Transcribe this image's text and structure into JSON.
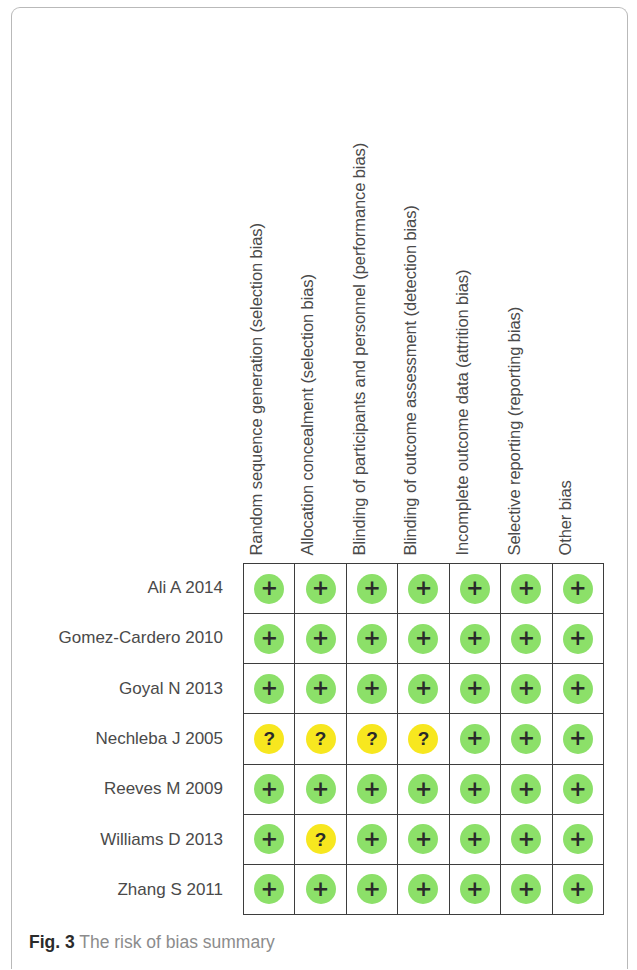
{
  "figure": {
    "caption_label": "Fig. 3",
    "caption_text": "The risk of bias summary",
    "colors": {
      "low_risk": "#8ce069",
      "unclear_risk": "#f7e71f",
      "grid_line": "#3d3d3d",
      "text": "#4a4a4a",
      "caption_text": "#8c8c8c"
    },
    "legend_glyphs": {
      "low_risk": "+",
      "unclear_risk": "?"
    }
  },
  "chart_data": {
    "type": "heatmap",
    "title": "The risk of bias summary",
    "xlabel": "",
    "ylabel": "",
    "grid": true,
    "legend_position": "none",
    "categories": [
      "Random sequence generation (selection bias)",
      "Allocation concealment (selection bias)",
      "Blinding of participants and personnel (performance bias)",
      "Blinding of outcome assessment (detection bias)",
      "Incomplete outcome data (attrition bias)",
      "Selective reporting (reporting bias)",
      "Other bias"
    ],
    "rows": [
      "Ali A 2014",
      "Gomez-Cardero 2010",
      "Goyal N 2013",
      "Nechleba J 2005",
      "Reeves M 2009",
      "Williams D 2013",
      "Zhang S 2011"
    ],
    "value_legend": {
      "+": "Low risk of bias",
      "?": "Unclear risk of bias",
      "-": "High risk of bias"
    },
    "values": [
      [
        "+",
        "+",
        "+",
        "+",
        "+",
        "+",
        "+"
      ],
      [
        "+",
        "+",
        "+",
        "+",
        "+",
        "+",
        "+"
      ],
      [
        "+",
        "+",
        "+",
        "+",
        "+",
        "+",
        "+"
      ],
      [
        "?",
        "?",
        "?",
        "?",
        "+",
        "+",
        "+"
      ],
      [
        "+",
        "+",
        "+",
        "+",
        "+",
        "+",
        "+"
      ],
      [
        "+",
        "?",
        "+",
        "+",
        "+",
        "+",
        "+"
      ],
      [
        "+",
        "+",
        "+",
        "+",
        "+",
        "+",
        "+"
      ]
    ]
  }
}
